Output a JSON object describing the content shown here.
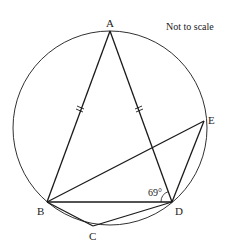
{
  "note": "Not to scale",
  "points": {
    "A": {
      "label": "A",
      "x": 110,
      "y": 31
    },
    "B": {
      "label": "B",
      "x": 47,
      "y": 202
    },
    "C": {
      "label": "C",
      "x": 93,
      "y": 226
    },
    "D": {
      "label": "D",
      "x": 172,
      "y": 202
    },
    "E": {
      "label": "E",
      "x": 204,
      "y": 121
    }
  },
  "circle": {
    "cx": 110,
    "cy": 128,
    "r": 97
  },
  "angle": {
    "label": "69°",
    "vertex": "D",
    "between": [
      "B",
      "A"
    ]
  },
  "equal_marks": [
    "AB",
    "AD"
  ],
  "segments": [
    "AB",
    "AD",
    "BD",
    "BC",
    "CD",
    "BE",
    "DE"
  ],
  "colors": {
    "stroke": "#1a1a1a",
    "text": "#222222"
  }
}
